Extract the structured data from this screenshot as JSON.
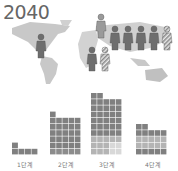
{
  "title": "2040",
  "chart_data": {
    "type": "bar",
    "style": "waffle/stacked unit cells",
    "title": "2040",
    "categories": [
      "1단계",
      "2단계",
      "3단계",
      "4단계"
    ],
    "columns_per_group": 5,
    "column_heights": [
      [
        2,
        1,
        1,
        1
      ],
      [
        7,
        6,
        6,
        6,
        6
      ],
      [
        10,
        10,
        9,
        9,
        9
      ],
      [
        5,
        5,
        4,
        4,
        4
      ]
    ],
    "values": [
      5,
      31,
      47,
      22
    ],
    "colors": {
      "dark": "#808080",
      "light": "#b4b4b4",
      "very_light": "#d8d8d8"
    },
    "grid": false,
    "legend": null
  },
  "pictogram": {
    "people": [
      {
        "x": 36,
        "y": 34,
        "shade": "dark"
      },
      {
        "x": 96,
        "y": 14,
        "shade": "medium"
      },
      {
        "x": 110,
        "y": 26,
        "shade": "dark"
      },
      {
        "x": 123,
        "y": 26,
        "shade": "dark"
      },
      {
        "x": 136,
        "y": 26,
        "shade": "dark"
      },
      {
        "x": 149,
        "y": 26,
        "shade": "dark"
      },
      {
        "x": 162,
        "y": 26,
        "shade": "striped"
      },
      {
        "x": 87,
        "y": 47,
        "shade": "dark"
      },
      {
        "x": 100,
        "y": 47,
        "shade": "striped"
      }
    ]
  }
}
